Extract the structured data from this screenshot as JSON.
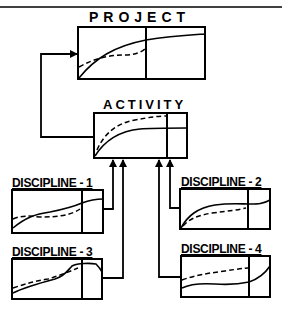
{
  "diagram": {
    "colors": {
      "line": "#000000",
      "background": "#ffffff"
    },
    "nodes": {
      "project": {
        "label": "PROJECT"
      },
      "activity": {
        "label": "ACTIVITY"
      },
      "discipline1": {
        "label": "DISCIPLINE - 1"
      },
      "discipline2": {
        "label": "DISCIPLINE - 2"
      },
      "discipline3": {
        "label": "DISCIPLINE - 3"
      },
      "discipline4": {
        "label": "DISCIPLINE - 4"
      }
    },
    "edges": [
      {
        "from": "discipline1",
        "to": "activity"
      },
      {
        "from": "discipline3",
        "to": "activity"
      },
      {
        "from": "discipline4",
        "to": "activity"
      },
      {
        "from": "discipline2",
        "to": "activity"
      },
      {
        "from": "activity",
        "to": "project"
      }
    ],
    "legend_lines": [
      "solid-curve",
      "dashed-curve"
    ]
  }
}
